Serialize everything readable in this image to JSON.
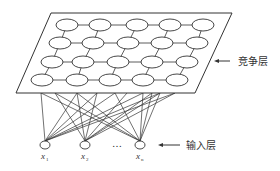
{
  "diagram": {
    "colors": {
      "stroke": "#333333",
      "background": "#ffffff",
      "text": "#333333"
    },
    "competitive_layer": {
      "label": "竞争层",
      "plane": {
        "tl": [
          51,
          13
        ],
        "tr": [
          232,
          13
        ],
        "br": [
          195,
          93
        ],
        "bl": [
          16,
          93
        ]
      },
      "rows": [
        {
          "y": 25,
          "xs": [
            67,
            100,
            137,
            170,
            203
          ]
        },
        {
          "y": 43,
          "xs": [
            60,
            93,
            128,
            162,
            197
          ]
        },
        {
          "y": 62,
          "xs": [
            52,
            83,
            118,
            152,
            187
          ]
        },
        {
          "y": 80,
          "xs": [
            42,
            77,
            110,
            143,
            177
          ]
        }
      ],
      "node_rx": 11,
      "node_ry": 6,
      "arrow": {
        "from": [
          230,
          61
        ],
        "to": [
          214,
          61
        ]
      },
      "label_pos": [
        238,
        65
      ]
    },
    "input_layer": {
      "label": "输入层",
      "nodes": [
        {
          "name": "x",
          "sub": "1",
          "cx": 45,
          "cy": 145
        },
        {
          "name": "x",
          "sub": "2",
          "cx": 85,
          "cy": 145
        },
        {
          "name": "x",
          "sub": "n",
          "cx": 140,
          "cy": 145
        }
      ],
      "ellipsis": "…",
      "ellipsis_pos": [
        112,
        147
      ],
      "node_rx": 5,
      "node_ry": 4,
      "arrow": {
        "from": [
          180,
          145
        ],
        "to": [
          158,
          145
        ]
      },
      "label_pos": [
        186,
        149
      ]
    },
    "connections": {
      "top_y": 93,
      "top_xs": [
        41,
        55,
        77,
        97,
        115,
        127,
        143,
        152,
        160,
        175
      ]
    }
  }
}
